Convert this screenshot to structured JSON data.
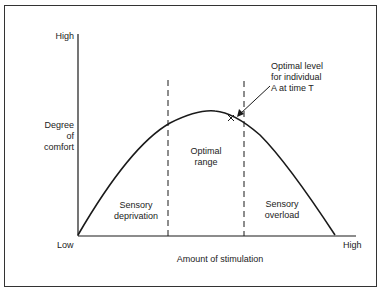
{
  "diagram": {
    "type": "inverted-u curve",
    "y_axis": {
      "high_label": "High",
      "title_lines": [
        "Degree",
        "of",
        "comfort"
      ]
    },
    "x_axis": {
      "low_label": "Low",
      "high_label": "High",
      "title": "Amount of stimulation"
    },
    "regions": [
      {
        "id": "deprivation",
        "lines": [
          "Sensory",
          "deprivation"
        ]
      },
      {
        "id": "optimal",
        "lines": [
          "Optimal",
          "range"
        ]
      },
      {
        "id": "overload",
        "lines": [
          "Sensory",
          "overload"
        ]
      }
    ],
    "annotation": {
      "lines": [
        "Optimal level",
        "for individual",
        "A at time T"
      ],
      "marker": "X"
    },
    "colors": {
      "line": "#1a1a1a",
      "frame": "#333333",
      "background": "#ffffff"
    }
  }
}
